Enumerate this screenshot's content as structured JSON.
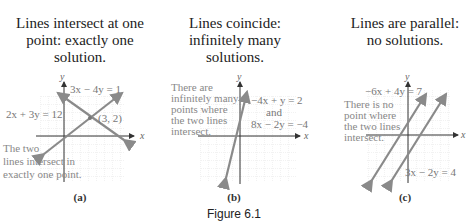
{
  "top_fragment": "for given solutions; graphs of systems and solution types",
  "panels": [
    {
      "id": "a",
      "title_lines": [
        "Lines intersect at one",
        "point: exactly one",
        "solution."
      ],
      "label": "(a)",
      "axis_x": "x",
      "axis_y": "y",
      "equations": [
        "3x − 4y = 1",
        "2x + 3y = 12"
      ],
      "point_label": "(3, 2)",
      "annotation_lines": [
        "The two",
        "lines intersect in",
        "exactly one point."
      ]
    },
    {
      "id": "b",
      "title_lines": [
        "Lines coincide:",
        "infinitely many",
        "solutions."
      ],
      "label": "(b)",
      "axis_x": "x",
      "axis_y": "y",
      "equations": [
        "−4x + y = 2",
        "and",
        "8x − 2y = −4"
      ],
      "annotation_lines": [
        "There are",
        "infinitely many",
        "points where",
        "the two lines",
        "intersect."
      ]
    },
    {
      "id": "c",
      "title_lines": [
        "Lines are parallel:",
        "no solutions."
      ],
      "label": "(c)",
      "axis_x": "x",
      "axis_y": "y",
      "equations": [
        "−6x + 4y = 7",
        "3x − 2y = 4"
      ],
      "annotation_lines": [
        "There is no",
        "point where",
        "the two lines",
        "intersect."
      ]
    }
  ],
  "caption": "Figure 6.1",
  "colors": {
    "line": "#8a8a8a",
    "grid": "#cfcfcf",
    "axis": "#333333",
    "annotation": "#888888"
  }
}
